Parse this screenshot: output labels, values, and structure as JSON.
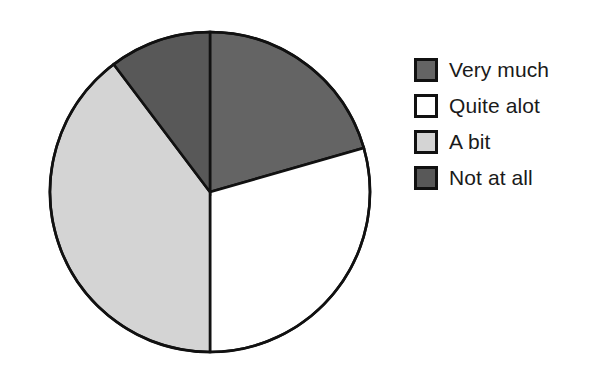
{
  "chart_data": {
    "type": "pie",
    "title": "",
    "subtitle": "",
    "xlabel": "",
    "ylabel": "",
    "grid": false,
    "legend_position": "right",
    "start_angle_deg": 0,
    "direction": "clockwise",
    "categories": [
      "Very much",
      "Quite alot",
      "A bit",
      "Not at all"
    ],
    "values": [
      20.5,
      29.5,
      39.7,
      10.3
    ],
    "units": "percent",
    "slice_angles_deg": [
      74,
      106,
      143,
      37
    ],
    "colors": [
      "#646464",
      "#ffffff",
      "#d4d4d4",
      "#585858"
    ],
    "slices": [
      {
        "label": "Very much",
        "value": 20.5,
        "angle_deg": 74,
        "start_deg": 0,
        "end_deg": 74,
        "color": "#646464"
      },
      {
        "label": "Quite alot",
        "value": 29.5,
        "angle_deg": 106,
        "start_deg": 74,
        "end_deg": 180,
        "color": "#ffffff"
      },
      {
        "label": "A bit",
        "value": 39.7,
        "angle_deg": 143,
        "start_deg": 180,
        "end_deg": 323,
        "color": "#d4d4d4"
      },
      {
        "label": "Not at all",
        "value": 10.3,
        "angle_deg": 37,
        "start_deg": 323,
        "end_deg": 360,
        "color": "#585858"
      }
    ],
    "annotations": []
  },
  "figure": {
    "background": "#ffffff",
    "outline_color": "#111111",
    "center_x": 210,
    "center_y": 192,
    "radius": 160
  },
  "legend": {
    "items": [
      {
        "label": "Very much",
        "color": "#646464",
        "swatch_name": "legend-swatch-very-much"
      },
      {
        "label": "Quite alot",
        "color": "#ffffff",
        "swatch_name": "legend-swatch-quite-alot"
      },
      {
        "label": "A bit",
        "color": "#d4d4d4",
        "swatch_name": "legend-swatch-a-bit"
      },
      {
        "label": "Not at all",
        "color": "#585858",
        "swatch_name": "legend-swatch-not-at-all"
      }
    ]
  }
}
